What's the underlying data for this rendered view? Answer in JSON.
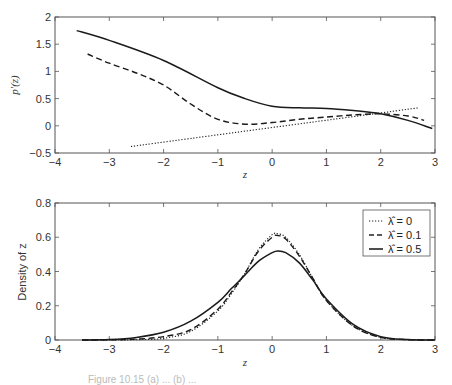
{
  "chart_data": [
    {
      "type": "line",
      "title": "",
      "xlabel": "z",
      "ylabel": "p'(z)",
      "xlim": [
        -4,
        3
      ],
      "ylim": [
        -0.5,
        2
      ],
      "xticks": [
        "-4",
        "-3",
        "-2",
        "-1",
        "0",
        "1",
        "2",
        "3"
      ],
      "yticks": [
        "-0.5",
        "0",
        "0.5",
        "1",
        "1.5",
        "2"
      ],
      "grid": false,
      "series": [
        {
          "name": "λ̂ = 0",
          "style": "dotted",
          "x": [
            -2.6,
            2.7
          ],
          "y": [
            -0.38,
            0.33
          ]
        },
        {
          "name": "λ̂ = 0.1",
          "style": "dashed",
          "x": [
            -3.4,
            -3.0,
            -2.5,
            -2.0,
            -1.5,
            -1.0,
            -0.5,
            0.0,
            0.5,
            1.0,
            1.5,
            2.0,
            2.5,
            2.8
          ],
          "y": [
            1.32,
            1.15,
            0.97,
            0.75,
            0.4,
            0.12,
            0.03,
            0.06,
            0.12,
            0.16,
            0.2,
            0.22,
            0.18,
            0.1
          ]
        },
        {
          "name": "λ̂ = 0.5",
          "style": "solid",
          "x": [
            -3.6,
            -3.0,
            -2.0,
            -1.0,
            -0.5,
            0.0,
            0.5,
            1.0,
            1.5,
            2.0,
            2.5,
            2.95
          ],
          "y": [
            1.75,
            1.57,
            1.2,
            0.7,
            0.5,
            0.36,
            0.33,
            0.32,
            0.28,
            0.22,
            0.1,
            -0.05
          ]
        }
      ]
    },
    {
      "type": "line",
      "title": "",
      "xlabel": "z",
      "ylabel": "Density of z",
      "xlim": [
        -4,
        3
      ],
      "ylim": [
        0,
        0.8
      ],
      "xticks": [
        "-4",
        "-3",
        "-2",
        "-1",
        "0",
        "1",
        "2",
        "3"
      ],
      "yticks": [
        "0",
        "0.2",
        "0.4",
        "0.6",
        "0.8"
      ],
      "grid": false,
      "legend_position": "upper right",
      "series": [
        {
          "name": "λ̂ = 0",
          "style": "dotted",
          "x": [
            -3.5,
            -3.0,
            -2.5,
            -2.0,
            -1.5,
            -1.0,
            -0.75,
            -0.5,
            -0.25,
            0.0,
            0.1,
            0.25,
            0.5,
            0.75,
            1.0,
            1.5,
            2.0,
            2.5,
            3.0
          ],
          "y": [
            0.0,
            0.0,
            0.002,
            0.01,
            0.05,
            0.17,
            0.27,
            0.39,
            0.53,
            0.615,
            0.62,
            0.6,
            0.5,
            0.36,
            0.23,
            0.08,
            0.015,
            0.002,
            0.0
          ]
        },
        {
          "name": "λ̂ = 0.1",
          "style": "dashed",
          "x": [
            -3.5,
            -3.0,
            -2.5,
            -2.0,
            -1.5,
            -1.0,
            -0.75,
            -0.5,
            -0.25,
            0.0,
            0.1,
            0.25,
            0.5,
            0.75,
            1.0,
            1.5,
            2.0,
            2.5,
            3.0
          ],
          "y": [
            0.0,
            0.001,
            0.005,
            0.02,
            0.06,
            0.18,
            0.28,
            0.39,
            0.52,
            0.6,
            0.61,
            0.59,
            0.49,
            0.36,
            0.23,
            0.08,
            0.015,
            0.002,
            0.0
          ]
        },
        {
          "name": "λ̂ = 0.5",
          "style": "solid",
          "x": [
            -3.5,
            -3.0,
            -2.5,
            -2.0,
            -1.5,
            -1.0,
            -0.75,
            -0.5,
            -0.25,
            0.0,
            0.1,
            0.25,
            0.5,
            0.75,
            1.0,
            1.5,
            2.0,
            2.5,
            3.0
          ],
          "y": [
            0.0,
            0.003,
            0.015,
            0.045,
            0.11,
            0.22,
            0.3,
            0.38,
            0.46,
            0.51,
            0.52,
            0.51,
            0.45,
            0.35,
            0.24,
            0.09,
            0.02,
            0.003,
            0.0
          ]
        }
      ]
    }
  ],
  "labels": {
    "top_ylabel": "p′(z)",
    "top_xlabel": "z",
    "bottom_ylabel": "Density of z",
    "bottom_xlabel": "z",
    "legend": [
      "λ̂ = 0",
      "λ̂ = 0.1",
      "λ̂ = 0.5"
    ],
    "caption_partial": "Figure 10.15 (a) ... (b) ..."
  }
}
